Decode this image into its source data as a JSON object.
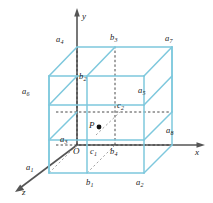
{
  "figure": {
    "type": "3d-cube-lattice-diagram",
    "colors": {
      "cube_edge": "#7ec8dd",
      "hidden_edge": "#3a3a3a",
      "axis": "#4d4d4d",
      "text": "#1a1a1a",
      "background": "#ffffff",
      "point_fill": "#111111"
    },
    "axes": [
      {
        "id": "axis-y",
        "label": "y",
        "direction": "up"
      },
      {
        "id": "axis-x",
        "label": "x",
        "direction": "right"
      },
      {
        "id": "axis-z",
        "label": "z",
        "direction": "lower-left"
      }
    ],
    "origin": {
      "id": "origin",
      "label": "O"
    },
    "interior_point": {
      "id": "point-p",
      "label": "P"
    },
    "corner_points": [
      {
        "id": "a1",
        "base": "a",
        "sub": "1"
      },
      {
        "id": "a2",
        "base": "a",
        "sub": "2"
      },
      {
        "id": "a3",
        "base": "a",
        "sub": "3"
      },
      {
        "id": "a4",
        "base": "a",
        "sub": "4"
      },
      {
        "id": "a5",
        "base": "a",
        "sub": "5"
      },
      {
        "id": "a6",
        "base": "a",
        "sub": "6"
      },
      {
        "id": "a7",
        "base": "a",
        "sub": "7"
      },
      {
        "id": "a8",
        "base": "a",
        "sub": "8"
      }
    ],
    "b_points": [
      {
        "id": "b1",
        "base": "b",
        "sub": "1"
      },
      {
        "id": "b2",
        "base": "b",
        "sub": "2"
      },
      {
        "id": "b3",
        "base": "b",
        "sub": "3"
      },
      {
        "id": "b4",
        "base": "b",
        "sub": "4"
      }
    ],
    "c_points": [
      {
        "id": "c1",
        "base": "c",
        "sub": "1"
      },
      {
        "id": "c2",
        "base": "c",
        "sub": "2"
      }
    ]
  },
  "labels": {
    "y": "y",
    "x": "x",
    "z": "z",
    "O": "O",
    "P": "P",
    "a1": "a",
    "a1s": "1",
    "a2": "a",
    "a2s": "2",
    "a3": "a",
    "a3s": "3",
    "a4": "a",
    "a4s": "4",
    "a5": "a",
    "a5s": "5",
    "a6": "a",
    "a6s": "6",
    "a7": "a",
    "a7s": "7",
    "a8": "a",
    "a8s": "8",
    "b1": "b",
    "b1s": "1",
    "b2": "b",
    "b2s": "2",
    "b3": "b",
    "b3s": "3",
    "b4": "b",
    "b4s": "4",
    "c1": "c",
    "c1s": "1",
    "c2": "c",
    "c2s": "2"
  }
}
